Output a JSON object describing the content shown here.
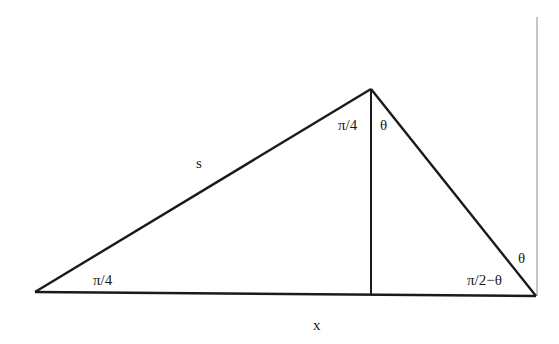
{
  "diagram": {
    "colors": {
      "stroke": "#1a1a1a",
      "background": "#ffffff",
      "right_edge": "#888888"
    },
    "labels": {
      "side_s": "s",
      "base_x": "x",
      "left_angle": "π/4",
      "apex_left_angle": "π/4",
      "apex_right_angle": "θ",
      "right_upper_angle": "θ",
      "right_base_angle": "π/2−θ"
    }
  }
}
